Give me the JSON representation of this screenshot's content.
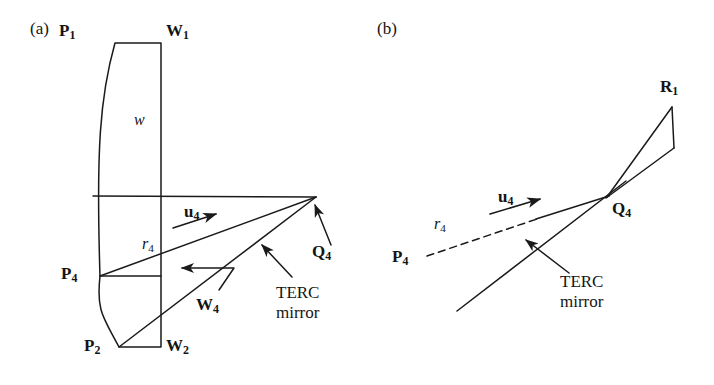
{
  "figure": {
    "width": 714,
    "height": 385,
    "background": "#ffffff",
    "stroke_color": "#1a1a1a",
    "text_color": "#141414"
  },
  "panels": [
    {
      "id": "a",
      "tag": "(a)",
      "tag_pos": {
        "x": 30,
        "y": 20
      },
      "description": "Lens cross-section with rays converging on point Q4 at the TERC mirror",
      "labels": [
        {
          "name": "point-p1",
          "base": "P",
          "subscript": "1",
          "style": "bold",
          "x": 59,
          "y": 22
        },
        {
          "name": "point-w1",
          "base": "W",
          "subscript": "1",
          "style": "bold",
          "x": 166,
          "y": 22
        },
        {
          "name": "width-w",
          "base": "w",
          "subscript": "",
          "style": "italic",
          "x": 134,
          "y": 112
        },
        {
          "name": "vector-u4",
          "base": "u",
          "subscript": "4",
          "style": "bold",
          "x": 184,
          "y": 203
        },
        {
          "name": "ray-r4",
          "base": "r",
          "subscript": "4",
          "style": "italic",
          "x": 142,
          "y": 236
        },
        {
          "name": "point-p4",
          "base": "P",
          "subscript": "4",
          "style": "bold",
          "x": 61,
          "y": 265
        },
        {
          "name": "point-q4",
          "base": "Q",
          "subscript": "4",
          "style": "bold",
          "x": 312,
          "y": 243
        },
        {
          "name": "point-w4",
          "base": "W",
          "subscript": "4",
          "style": "bold",
          "x": 196,
          "y": 296
        },
        {
          "name": "point-p2",
          "base": "P",
          "subscript": "2",
          "style": "bold",
          "x": 84,
          "y": 337
        },
        {
          "name": "point-w2",
          "base": "W",
          "subscript": "2",
          "style": "bold",
          "x": 166,
          "y": 337
        }
      ],
      "annotations": [
        {
          "name": "terc-mirror-annotation",
          "lines": [
            "TERC",
            "mirror"
          ],
          "x": 276,
          "y": 283
        }
      ]
    },
    {
      "id": "b",
      "tag": "(b)",
      "tag_pos": {
        "x": 377,
        "y": 20
      },
      "description": "Detail of incident ray r4 from P4 reflecting at Q4 on the TERC mirror toward R1",
      "labels": [
        {
          "name": "point-r1",
          "base": "R",
          "subscript": "1",
          "style": "bold",
          "x": 660,
          "y": 78
        },
        {
          "name": "vector-u4",
          "base": "u",
          "subscript": "4",
          "style": "bold",
          "x": 498,
          "y": 188
        },
        {
          "name": "point-q4",
          "base": "Q",
          "subscript": "4",
          "style": "bold",
          "x": 612,
          "y": 200
        },
        {
          "name": "ray-r4",
          "base": "r",
          "subscript": "4",
          "style": "italic",
          "x": 434,
          "y": 216
        },
        {
          "name": "point-p4",
          "base": "P",
          "subscript": "4",
          "style": "bold",
          "x": 392,
          "y": 248
        }
      ],
      "annotations": [
        {
          "name": "terc-mirror-annotation",
          "lines": [
            "TERC",
            "mirror"
          ],
          "x": 560,
          "y": 272
        }
      ]
    }
  ],
  "geometry": {
    "panel_a": {
      "lens_top_edge": {
        "from": [
          115,
          43
        ],
        "to": [
          161,
          43
        ]
      },
      "lens_bottom_edge": {
        "from": [
          119,
          347
        ],
        "to": [
          161,
          347
        ]
      },
      "lens_right_edge": {
        "from": [
          161,
          43
        ],
        "to": [
          161,
          347
        ]
      },
      "lens_left_curve_upper": {
        "from": [
          115,
          43
        ],
        "ctrl": [
          96,
          150
        ],
        "to": [
          100,
          276
        ]
      },
      "lens_left_curve_lower": {
        "from": [
          100,
          276
        ],
        "ctrl": [
          104,
          318
        ],
        "to": [
          119,
          347
        ]
      },
      "axis_line": {
        "from": [
          93,
          196
        ],
        "to": [
          316,
          197
        ]
      },
      "chord_p4": {
        "from": [
          100,
          276
        ],
        "to": [
          161,
          276
        ]
      },
      "ray_p4_q4": {
        "from": [
          100,
          276
        ],
        "to": [
          316,
          197
        ]
      },
      "ray_p2_q4": {
        "from": [
          119,
          347
        ],
        "to": [
          316,
          197
        ]
      },
      "u4_arrow": {
        "from": [
          173,
          228
        ],
        "to": [
          221,
          213
        ]
      },
      "q4_leader_arrow": {
        "from": [
          330,
          243
        ],
        "to": [
          314,
          203
        ]
      },
      "mirror_leader_arrow": {
        "from": [
          290,
          275
        ],
        "to": [
          260,
          243
        ]
      },
      "w4_leader": {
        "segments": [
          [
            218,
            289
          ],
          [
            233,
            268
          ],
          [
            178,
            268
          ]
        ]
      },
      "q4_point": [
        316,
        197
      ]
    },
    "panel_b": {
      "incident_ray_dashed": {
        "from": [
          425,
          256
        ],
        "to": [
          540,
          218
        ]
      },
      "incident_ray_solid": {
        "from": [
          540,
          218
        ],
        "to": [
          608,
          196
        ]
      },
      "mirror_line": {
        "from": [
          457,
          311
        ],
        "to": [
          625,
          182
        ]
      },
      "reflected_ray": {
        "from": [
          608,
          196
        ],
        "to": [
          672,
          107
        ]
      },
      "r1_drop": {
        "from": [
          672,
          107
        ],
        "to": [
          674,
          148
        ]
      },
      "r1_return": {
        "from": [
          674,
          148
        ],
        "to": [
          605,
          198
        ]
      },
      "u4_arrow": {
        "from": [
          490,
          214
        ],
        "to": [
          545,
          197
        ]
      },
      "mirror_leader_arrow": {
        "from": [
          567,
          271
        ],
        "to": [
          524,
          238
        ]
      },
      "q4_point": [
        608,
        196
      ]
    }
  }
}
